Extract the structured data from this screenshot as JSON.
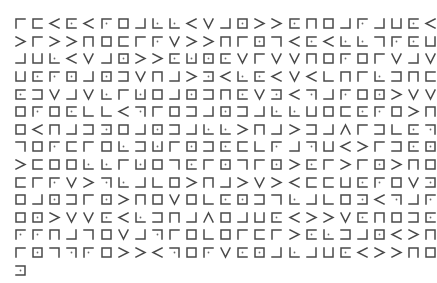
{
  "document": {
    "type": "pigpen-cipher-text",
    "legend": {
      "shapes": {
        "TL": "corner open right-bottom (┌)",
        "T": "open bottom (⊓)",
        "TR": "corner open left-bottom (┐)",
        "L": "open right (⊏)",
        "C": "full box (□)",
        "R": "open left (⊐)",
        "BL": "corner open right-top (└)",
        "B": "open top (⊔)",
        "BR": "corner open left-top (┘)",
        "XV": "V shape",
        "XG": "> shape",
        "XL": "< shape",
        "XA": "∧ shape"
      },
      "dot_suffix": "* = glyph contains a dot"
    },
    "rows": [
      [
        "TL",
        "L",
        "XL",
        "L*",
        "XL",
        "TL*",
        "C",
        "BR",
        "BL*",
        "BL*",
        "XL",
        "XV",
        "BR",
        "C*",
        "XG",
        "XG",
        "L*",
        "T",
        "C",
        "BR",
        "TL*",
        "BR",
        "B",
        "L*",
        "XL"
      ],
      [
        "XG",
        "TL",
        "XG",
        "XG",
        "T",
        "C",
        "L",
        "TL",
        "TL*",
        "XV",
        "XG",
        "XG",
        "T",
        "TL",
        "C*",
        "TR",
        "XL",
        "L*",
        "XL",
        "BL*",
        "BL*",
        "TR",
        "TL*",
        "L*",
        "B"
      ],
      [
        "BR",
        "B",
        "BL*",
        "XL",
        "XV",
        "BR",
        "C*",
        "XG",
        "XG",
        "L*",
        "B*",
        "C*",
        "L*",
        "XV",
        "TL",
        "XV",
        "XV",
        "T",
        "C",
        "TL*",
        "C",
        "TL",
        "XV",
        "BR",
        "XV"
      ],
      [
        "B",
        "L*",
        "TL*",
        "C*",
        "BR",
        "C*",
        "R",
        "XV",
        "T",
        "BR",
        "XG",
        "R*",
        "XL",
        "BL*",
        "L*",
        "XL",
        "XV",
        "XL",
        "BL",
        "T",
        "TL",
        "BL*",
        "R",
        "T",
        "L"
      ],
      [
        "L*",
        "R",
        "XV",
        "BR",
        "XV",
        "BL*",
        "TL",
        "B*",
        "C",
        "BR",
        "C*",
        "R",
        "T",
        "L*",
        "XV",
        "R*",
        "XL",
        "TR*",
        "BR",
        "TL*",
        "C",
        "C*",
        "XG",
        "XV",
        "XV"
      ],
      [
        "C",
        "TL*",
        "C",
        "L*",
        "BL",
        "BL",
        "XL",
        "TR*",
        "TL",
        "C",
        "R",
        "BR",
        "C*",
        "R",
        "BR",
        "BL*",
        "BL*",
        "B",
        "C",
        "L",
        "L*",
        "TL*",
        "C",
        "XG",
        "T"
      ],
      [
        "C",
        "XL",
        "T",
        "BR",
        "R",
        "R*",
        "C",
        "BR",
        "C*",
        "R",
        "BR",
        "BL*",
        "BL*",
        "XG",
        "T",
        "BR",
        "XG",
        "R",
        "BR",
        "XA",
        "TL",
        "R",
        "BL",
        "L*",
        "TR*"
      ],
      [
        "TR",
        "C",
        "TL*",
        "L",
        "TL",
        "C",
        "BL*",
        "R",
        "B*",
        "TL",
        "C*",
        "R",
        "L*",
        "L",
        "BL",
        "TL*",
        "BR",
        "TR*",
        "B",
        "XL",
        "XG",
        "TL",
        "R",
        "L*",
        "C*"
      ],
      [
        "XG",
        "L",
        "C",
        "C",
        "BL*",
        "BL*",
        "TL",
        "B*",
        "C",
        "TR",
        "L*",
        "TL",
        "C*",
        "TR",
        "TL",
        "C*",
        "XG",
        "L*",
        "TL",
        "XG",
        "TL",
        "C*",
        "XG",
        "T",
        "C"
      ],
      [
        "L",
        "TL",
        "TL*",
        "XV",
        "XG",
        "TR*",
        "BL*",
        "BR",
        "BL",
        "C",
        "XG",
        "T",
        "BR",
        "XG",
        "XV",
        "XG",
        "XL",
        "L",
        "L",
        "B",
        "L*",
        "TL*",
        "C",
        "XV",
        "R*"
      ],
      [
        "C",
        "BR",
        "C*",
        "R",
        "TL",
        "C*",
        "XG",
        "T",
        "C",
        "XV",
        "C",
        "BL",
        "L*",
        "C*",
        "R",
        "TR",
        "BL*",
        "BR",
        "BL",
        "C",
        "R*",
        "XL",
        "TR*",
        "BR",
        "TL*"
      ],
      [
        "C",
        "C*",
        "XG",
        "XV",
        "XV",
        "L*",
        "XL",
        "BL*",
        "R",
        "T",
        "BR",
        "XA",
        "C",
        "BR",
        "B",
        "L*",
        "XL",
        "XG",
        "XG",
        "XV",
        "L*",
        "T",
        "C",
        "R",
        "L*"
      ],
      [
        "TL*",
        "TL*",
        "T",
        "BR",
        "TR",
        "C",
        "XV",
        "BR",
        "TR*",
        "TL",
        "C",
        "BL",
        "C",
        "TL",
        "L",
        "TL",
        "XG",
        "L*",
        "BL*",
        "R",
        "BR",
        "C*",
        "XL",
        "XG",
        "T"
      ],
      [
        "TL",
        "C*",
        "TR",
        "TR*",
        "TL*",
        "C",
        "XG",
        "XG",
        "XL",
        "TR*",
        "C",
        "TL*",
        "XV",
        "L*",
        "C*",
        "BR",
        "BL*",
        "BR",
        "B",
        "L*",
        "XL",
        "XG",
        "XG",
        "T",
        "C"
      ],
      [
        "R*"
      ]
    ]
  },
  "style": {
    "stroke_color": "#4a4a4a",
    "background": "#ffffff"
  }
}
